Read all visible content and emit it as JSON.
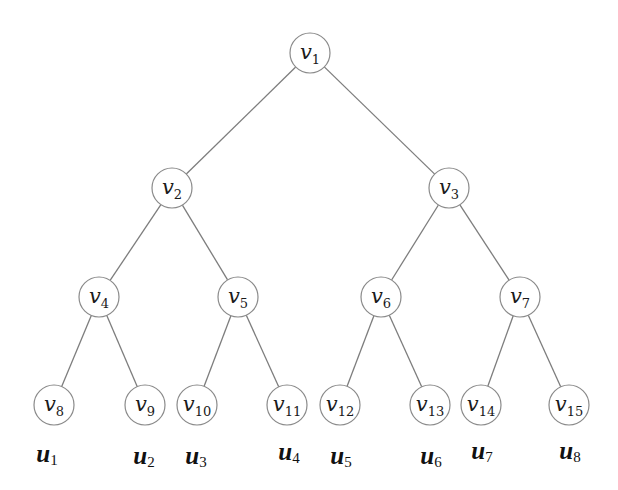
{
  "diagram": {
    "type": "complete-binary-tree",
    "colors": {
      "edge": "#7d7d7d",
      "node_stroke": "#8a8a8a",
      "node_fill": "#ffffff",
      "text": "#1a1a1a"
    },
    "nodes": [
      {
        "id": "v1",
        "base": "v",
        "sub": "1",
        "x": 310,
        "y": 53
      },
      {
        "id": "v2",
        "base": "v",
        "sub": "2",
        "x": 172,
        "y": 188
      },
      {
        "id": "v3",
        "base": "v",
        "sub": "3",
        "x": 449,
        "y": 188
      },
      {
        "id": "v4",
        "base": "v",
        "sub": "4",
        "x": 99,
        "y": 297
      },
      {
        "id": "v5",
        "base": "v",
        "sub": "5",
        "x": 238,
        "y": 297
      },
      {
        "id": "v6",
        "base": "v",
        "sub": "6",
        "x": 381,
        "y": 297
      },
      {
        "id": "v7",
        "base": "v",
        "sub": "7",
        "x": 520,
        "y": 297
      },
      {
        "id": "v8",
        "base": "v",
        "sub": "8",
        "x": 54,
        "y": 405
      },
      {
        "id": "v9",
        "base": "v",
        "sub": "9",
        "x": 145,
        "y": 405
      },
      {
        "id": "v10",
        "base": "v",
        "sub": "10",
        "x": 197,
        "y": 405
      },
      {
        "id": "v11",
        "base": "v",
        "sub": "11",
        "x": 287,
        "y": 405
      },
      {
        "id": "v12",
        "base": "v",
        "sub": "12",
        "x": 340,
        "y": 405
      },
      {
        "id": "v13",
        "base": "v",
        "sub": "13",
        "x": 430,
        "y": 405
      },
      {
        "id": "v14",
        "base": "v",
        "sub": "14",
        "x": 481,
        "y": 405
      },
      {
        "id": "v15",
        "base": "v",
        "sub": "15",
        "x": 569,
        "y": 405
      }
    ],
    "edges": [
      [
        "v1",
        "v2"
      ],
      [
        "v1",
        "v3"
      ],
      [
        "v2",
        "v4"
      ],
      [
        "v2",
        "v5"
      ],
      [
        "v3",
        "v6"
      ],
      [
        "v3",
        "v7"
      ],
      [
        "v4",
        "v8"
      ],
      [
        "v4",
        "v9"
      ],
      [
        "v5",
        "v10"
      ],
      [
        "v5",
        "v11"
      ],
      [
        "v6",
        "v12"
      ],
      [
        "v6",
        "v13"
      ],
      [
        "v7",
        "v14"
      ],
      [
        "v7",
        "v15"
      ]
    ],
    "leaf_labels": [
      {
        "id": "u1",
        "base": "u",
        "sub": "1",
        "x": 47,
        "y": 462
      },
      {
        "id": "u2",
        "base": "u",
        "sub": "2",
        "x": 144,
        "y": 464
      },
      {
        "id": "u3",
        "base": "u",
        "sub": "3",
        "x": 196,
        "y": 464
      },
      {
        "id": "u4",
        "base": "u",
        "sub": "4",
        "x": 289,
        "y": 460
      },
      {
        "id": "u5",
        "base": "u",
        "sub": "5",
        "x": 341,
        "y": 464
      },
      {
        "id": "u6",
        "base": "u",
        "sub": "6",
        "x": 431,
        "y": 464
      },
      {
        "id": "u7",
        "base": "u",
        "sub": "7",
        "x": 482,
        "y": 459
      },
      {
        "id": "u8",
        "base": "u",
        "sub": "8",
        "x": 570,
        "y": 459
      }
    ],
    "node_radius": 20
  }
}
